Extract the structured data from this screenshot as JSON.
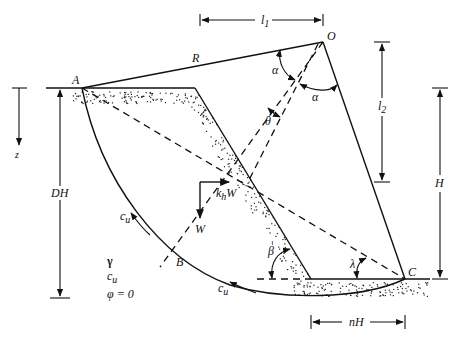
{
  "figure": {
    "type": "slope-stability-circular-failure-diagram",
    "labels": {
      "O": "O",
      "A": "A",
      "B": "B",
      "C": "C",
      "R": "R",
      "l1": "l",
      "l1_sub": "1",
      "l2": "l",
      "l2_sub": "2",
      "H": "H",
      "DH": "DH",
      "nH": "nH",
      "z": "z",
      "alpha_1": "α",
      "alpha_2": "α",
      "theta": "θ",
      "beta": "β",
      "lambda": "λ",
      "W": "W",
      "khW": "k",
      "khW_sub": "h",
      "khW_tail": "W",
      "cu_left": "c",
      "cu_left_sub": "u",
      "cu_bottom": "c",
      "cu_bottom_sub": "u"
    },
    "soil_properties": {
      "gamma": "γ",
      "cu": "c",
      "cu_sub": "u",
      "phi": "φ = 0"
    },
    "geometry": {
      "center_O": [
        323,
        42
      ],
      "point_A": [
        82,
        88
      ],
      "slope_crest": [
        195,
        88
      ],
      "slope_toe": [
        311,
        279
      ],
      "point_C": [
        405,
        279
      ],
      "point_B": [
        175,
        267
      ]
    },
    "colors": {
      "line": "#111111",
      "background": "#ffffff",
      "stipple": "#222222"
    }
  }
}
